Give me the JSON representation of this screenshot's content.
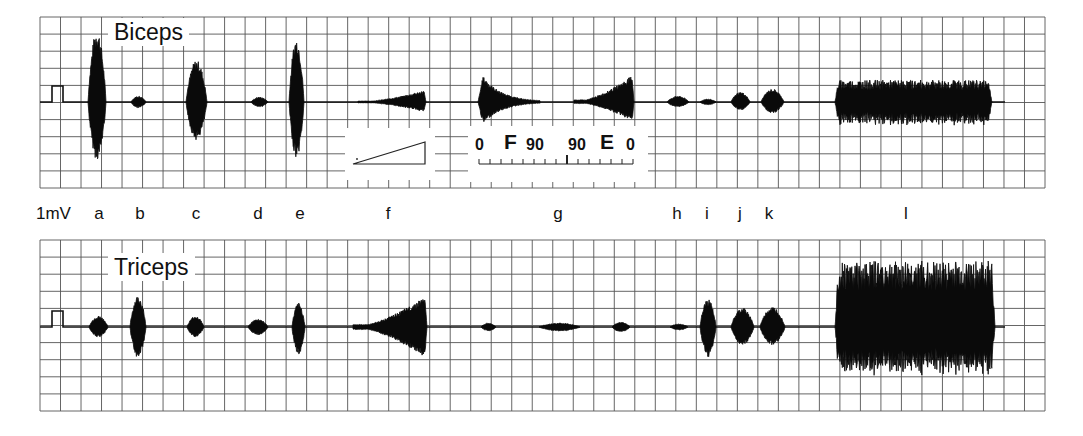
{
  "figure": {
    "panels": [
      {
        "id": "biceps",
        "title": "Biceps"
      },
      {
        "id": "triceps",
        "title": "Triceps"
      }
    ],
    "calibration_label": "1mV",
    "condition_labels": [
      {
        "label": "a",
        "x": 99
      },
      {
        "label": "b",
        "x": 140
      },
      {
        "label": "c",
        "x": 196
      },
      {
        "label": "d",
        "x": 258
      },
      {
        "label": "e",
        "x": 300
      },
      {
        "label": "f",
        "x": 388
      },
      {
        "label": "g",
        "x": 558
      },
      {
        "label": "h",
        "x": 677
      },
      {
        "label": "i",
        "x": 707
      },
      {
        "label": "j",
        "x": 740
      },
      {
        "label": "k",
        "x": 769
      },
      {
        "label": "l",
        "x": 906
      }
    ],
    "ramp_legend": {
      "shape": "ramp-triangle"
    },
    "angle_scale": {
      "labels": [
        "0",
        "F",
        "90",
        "90",
        "E",
        "0"
      ],
      "description": "Flexion 0→90°, Extension 90→0°"
    }
  },
  "chart_data": {
    "type": "emg-trace",
    "title": "",
    "xlabel": "",
    "ylabel": "",
    "grid": true,
    "series": [
      {
        "name": "Biceps",
        "baseline_y": 102,
        "bursts": [
          {
            "label": "a",
            "x0": 88,
            "x1": 106,
            "amp_up": 72,
            "amp_down": 58,
            "shape": "spindle"
          },
          {
            "label": "b",
            "x0": 131,
            "x1": 146,
            "amp_up": 6,
            "amp_down": 6,
            "shape": "spindle"
          },
          {
            "label": "c",
            "x0": 186,
            "x1": 207,
            "amp_up": 42,
            "amp_down": 38,
            "shape": "spindle"
          },
          {
            "label": "d",
            "x0": 251,
            "x1": 268,
            "amp_up": 5,
            "amp_down": 5,
            "shape": "spindle"
          },
          {
            "label": "e",
            "x0": 289,
            "x1": 304,
            "amp_up": 64,
            "amp_down": 56,
            "shape": "spindle"
          },
          {
            "label": "f",
            "x0": 358,
            "x1": 426,
            "amp_up": 12,
            "amp_down": 10,
            "shape": "ramp-up"
          },
          {
            "label": "g1",
            "x0": 478,
            "x1": 540,
            "amp_up": 26,
            "amp_down": 22,
            "shape": "decay"
          },
          {
            "label": "g2",
            "x0": 574,
            "x1": 634,
            "amp_up": 28,
            "amp_down": 20,
            "shape": "ramp-up"
          },
          {
            "label": "h",
            "x0": 667,
            "x1": 689,
            "amp_up": 6,
            "amp_down": 5,
            "shape": "spindle"
          },
          {
            "label": "i",
            "x0": 700,
            "x1": 716,
            "amp_up": 3,
            "amp_down": 3,
            "shape": "spindle"
          },
          {
            "label": "j",
            "x0": 731,
            "x1": 750,
            "amp_up": 10,
            "amp_down": 8,
            "shape": "spindle"
          },
          {
            "label": "k",
            "x0": 761,
            "x1": 784,
            "amp_up": 13,
            "amp_down": 11,
            "shape": "spindle"
          },
          {
            "label": "l",
            "x0": 835,
            "x1": 992,
            "amp_up": 22,
            "amp_down": 24,
            "shape": "noise"
          }
        ]
      },
      {
        "name": "Triceps",
        "baseline_y": 327,
        "bursts": [
          {
            "label": "a",
            "x0": 89,
            "x1": 108,
            "amp_up": 11,
            "amp_down": 10,
            "shape": "spindle"
          },
          {
            "label": "b",
            "x0": 130,
            "x1": 146,
            "amp_up": 31,
            "amp_down": 31,
            "shape": "spindle"
          },
          {
            "label": "c",
            "x0": 187,
            "x1": 204,
            "amp_up": 11,
            "amp_down": 10,
            "shape": "spindle"
          },
          {
            "label": "d",
            "x0": 248,
            "x1": 268,
            "amp_up": 8,
            "amp_down": 8,
            "shape": "spindle"
          },
          {
            "label": "e",
            "x0": 292,
            "x1": 305,
            "amp_up": 24,
            "amp_down": 27,
            "shape": "spindle"
          },
          {
            "label": "f",
            "x0": 353,
            "x1": 427,
            "amp_up": 32,
            "amp_down": 32,
            "shape": "ramp-up"
          },
          {
            "label": "g1",
            "x0": 481,
            "x1": 496,
            "amp_up": 4,
            "amp_down": 4,
            "shape": "spindle"
          },
          {
            "label": "g2",
            "x0": 539,
            "x1": 580,
            "amp_up": 4,
            "amp_down": 4,
            "shape": "spindle"
          },
          {
            "label": "g3",
            "x0": 612,
            "x1": 630,
            "amp_up": 5,
            "amp_down": 5,
            "shape": "spindle"
          },
          {
            "label": "h",
            "x0": 670,
            "x1": 688,
            "amp_up": 3,
            "amp_down": 3,
            "shape": "spindle"
          },
          {
            "label": "i",
            "x0": 700,
            "x1": 716,
            "amp_up": 28,
            "amp_down": 30,
            "shape": "spindle"
          },
          {
            "label": "j",
            "x0": 731,
            "x1": 754,
            "amp_up": 19,
            "amp_down": 18,
            "shape": "spindle"
          },
          {
            "label": "k",
            "x0": 760,
            "x1": 785,
            "amp_up": 20,
            "amp_down": 18,
            "shape": "spindle"
          },
          {
            "label": "l",
            "x0": 835,
            "x1": 995,
            "amp_up": 66,
            "amp_down": 50,
            "shape": "noise"
          }
        ]
      }
    ],
    "calibration_pulse": {
      "label": "1mV",
      "height_px": 16
    }
  }
}
